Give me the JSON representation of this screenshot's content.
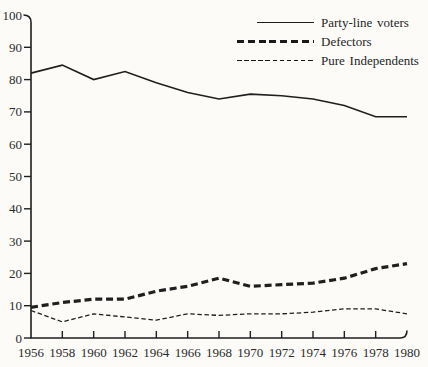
{
  "figure": {
    "background": "#fcfbf8",
    "ink": "#1f1f1f",
    "text_color": "#2b2b2b"
  },
  "chart_data": {
    "type": "line",
    "title": "",
    "xlabel": "",
    "ylabel": "",
    "x": [
      1956,
      1958,
      1960,
      1962,
      1964,
      1966,
      1968,
      1970,
      1972,
      1974,
      1976,
      1978,
      1980
    ],
    "xlim": [
      1956,
      1980
    ],
    "ylim": [
      0,
      100
    ],
    "yticks": [
      0,
      10,
      20,
      30,
      40,
      50,
      60,
      70,
      80,
      90,
      100
    ],
    "grid": false,
    "legend_position": "top-right",
    "series": [
      {
        "id": "party-line-voters",
        "name": "Party-line voters",
        "style": "solid",
        "values": [
          82,
          84.5,
          80,
          82.5,
          79,
          76,
          74,
          75.5,
          75,
          74,
          72,
          68.5,
          68.5
        ]
      },
      {
        "id": "defectors",
        "name": "Defectors",
        "style": "dashed-thick",
        "values": [
          9.5,
          11,
          12,
          12,
          14.5,
          16,
          18.5,
          16,
          16.5,
          17,
          18.5,
          21.5,
          23
        ]
      },
      {
        "id": "pure-independents",
        "name": "Pure Independents",
        "style": "dashed-thin",
        "values": [
          8.5,
          5,
          7.5,
          6.5,
          5.5,
          7.5,
          7,
          7.5,
          7.5,
          8,
          9,
          9,
          7.5
        ]
      }
    ]
  }
}
